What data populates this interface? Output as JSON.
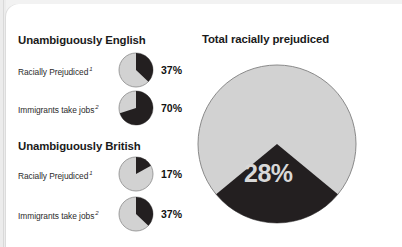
{
  "colors": {
    "page_background": "#ffffff",
    "outer_background": "#f2f2f2",
    "slice_dark": "#231f20",
    "slice_light": "#d2d2d2",
    "slice_stroke": "#8a8a8a",
    "heading_text": "#1a1a1a",
    "label_text": "#2b2b2b",
    "big_pct_text": "#d8d8d8"
  },
  "groups": [
    {
      "heading": "Unambiguously English",
      "rows": [
        {
          "label": "Racially Prejudiced",
          "footnote": "1",
          "value": "37%",
          "percent": 37
        },
        {
          "label": "Immigrants take jobs",
          "footnote": "2",
          "value": "70%",
          "percent": 70
        }
      ]
    },
    {
      "heading": "Unambiguously British",
      "rows": [
        {
          "label": "Racially Prejudiced",
          "footnote": "1",
          "value": "17%",
          "percent": 17
        },
        {
          "label": "Immigrants take jobs",
          "footnote": "2",
          "value": "37%",
          "percent": 37
        }
      ]
    }
  ],
  "total": {
    "title": "Total racially prejudiced",
    "value": "28%",
    "percent": 28
  },
  "chart_data": [
    {
      "type": "pie",
      "title": "Unambiguously English — Racially Prejudiced",
      "categories": [
        "Racially Prejudiced",
        "Not prejudiced"
      ],
      "values": [
        37,
        63
      ],
      "labels": [
        "37%",
        ""
      ],
      "legend": "none",
      "colors": [
        "#231f20",
        "#d2d2d2"
      ],
      "start_angle_deg": 0,
      "direction": "clockwise"
    },
    {
      "type": "pie",
      "title": "Unambiguously English — Immigrants take jobs",
      "categories": [
        "Agree",
        "Disagree"
      ],
      "values": [
        70,
        30
      ],
      "labels": [
        "70%",
        ""
      ],
      "legend": "none",
      "colors": [
        "#231f20",
        "#d2d2d2"
      ],
      "start_angle_deg": 0,
      "direction": "clockwise"
    },
    {
      "type": "pie",
      "title": "Unambiguously British — Racially Prejudiced",
      "categories": [
        "Racially Prejudiced",
        "Not prejudiced"
      ],
      "values": [
        17,
        83
      ],
      "labels": [
        "17%",
        ""
      ],
      "legend": "none",
      "colors": [
        "#231f20",
        "#d2d2d2"
      ],
      "start_angle_deg": 0,
      "direction": "clockwise"
    },
    {
      "type": "pie",
      "title": "Unambiguously British — Immigrants take jobs",
      "categories": [
        "Agree",
        "Disagree"
      ],
      "values": [
        37,
        63
      ],
      "labels": [
        "37%",
        ""
      ],
      "legend": "none",
      "colors": [
        "#231f20",
        "#d2d2d2"
      ],
      "start_angle_deg": 0,
      "direction": "clockwise"
    },
    {
      "type": "pie",
      "title": "Total racially prejudiced",
      "categories": [
        "Racially prejudiced",
        "Not racially prejudiced"
      ],
      "values": [
        28,
        72
      ],
      "labels": [
        "28%",
        ""
      ],
      "legend": "none",
      "colors": [
        "#231f20",
        "#d2d2d2"
      ],
      "start_angle_deg": 129.6,
      "direction": "clockwise"
    }
  ]
}
